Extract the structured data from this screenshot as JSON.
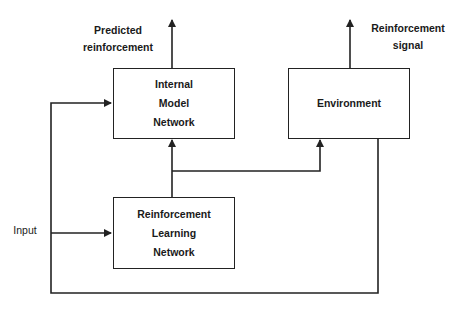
{
  "diagram": {
    "type": "block-diagram",
    "nodes": [
      {
        "id": "internal_model",
        "lines": [
          "Internal",
          "Model",
          "Network"
        ]
      },
      {
        "id": "environment",
        "lines": [
          "Environment"
        ]
      },
      {
        "id": "rl_network",
        "lines": [
          "Reinforcement",
          "Learning",
          "Network"
        ]
      }
    ],
    "labels": {
      "predicted": [
        "Predicted",
        "reinforcement"
      ],
      "signal": [
        "Reinforcement",
        "signal"
      ],
      "input": "Input"
    },
    "edges": [
      {
        "from": "input",
        "to": "rl_network"
      },
      {
        "from": "input",
        "to": "internal_model"
      },
      {
        "from": "rl_network",
        "to": "internal_model"
      },
      {
        "from": "rl_network",
        "to": "environment"
      },
      {
        "from": "internal_model",
        "to": "predicted_reinforcement_output"
      },
      {
        "from": "environment",
        "to": "reinforcement_signal_output"
      },
      {
        "from": "environment",
        "to": "input_feedback"
      }
    ],
    "colors": {
      "line": "#222222",
      "background": "#ffffff"
    }
  }
}
